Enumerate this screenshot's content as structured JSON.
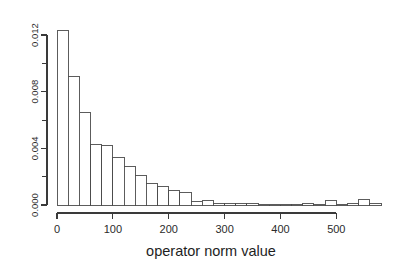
{
  "figure": {
    "background_color": "#ffffff",
    "axis_color": "#3a3a3a",
    "bar_fill_color": "#ffffff",
    "bar_stroke_color": "#4a4a4a"
  },
  "chart_data": {
    "type": "bar",
    "subtype": "histogram",
    "title": "",
    "subtitle": "",
    "xlabel": "operator norm value",
    "ylabel": "",
    "grid": false,
    "legend": false,
    "legend_position": "none",
    "xlim": [
      0,
      580
    ],
    "ylim": [
      0,
      0.0132
    ],
    "bin_width": 20,
    "x_ticks": [
      0,
      100,
      200,
      300,
      400,
      500
    ],
    "x_tick_labels": [
      "0",
      "100",
      "200",
      "300",
      "400",
      "500"
    ],
    "y_ticks": [
      0.0,
      0.004,
      0.008,
      0.012
    ],
    "y_tick_labels": [
      "0.000",
      "0.004",
      "0.008",
      "0.012"
    ],
    "y_minor_ticks": [
      0.002,
      0.006,
      0.01
    ],
    "bins": [
      {
        "x0": 0,
        "x1": 20,
        "density": 0.01235
      },
      {
        "x0": 20,
        "x1": 40,
        "density": 0.00905
      },
      {
        "x0": 40,
        "x1": 60,
        "density": 0.00655
      },
      {
        "x0": 60,
        "x1": 80,
        "density": 0.00425
      },
      {
        "x0": 80,
        "x1": 100,
        "density": 0.0042
      },
      {
        "x0": 100,
        "x1": 120,
        "density": 0.00335
      },
      {
        "x0": 120,
        "x1": 140,
        "density": 0.0027
      },
      {
        "x0": 140,
        "x1": 160,
        "density": 0.00205
      },
      {
        "x0": 160,
        "x1": 180,
        "density": 0.0015
      },
      {
        "x0": 180,
        "x1": 200,
        "density": 0.0013
      },
      {
        "x0": 200,
        "x1": 220,
        "density": 0.00105
      },
      {
        "x0": 220,
        "x1": 240,
        "density": 0.0009
      },
      {
        "x0": 240,
        "x1": 260,
        "density": 0.00022
      },
      {
        "x0": 260,
        "x1": 280,
        "density": 0.0003
      },
      {
        "x0": 280,
        "x1": 300,
        "density": 8e-05
      },
      {
        "x0": 300,
        "x1": 320,
        "density": 0.00014
      },
      {
        "x0": 320,
        "x1": 340,
        "density": 8e-05
      },
      {
        "x0": 340,
        "x1": 360,
        "density": 0.00014
      },
      {
        "x0": 360,
        "x1": 380,
        "density": 6e-05
      },
      {
        "x0": 380,
        "x1": 400,
        "density": 4e-05
      },
      {
        "x0": 400,
        "x1": 420,
        "density": 4e-05
      },
      {
        "x0": 420,
        "x1": 440,
        "density": 4e-05
      },
      {
        "x0": 440,
        "x1": 460,
        "density": 0.0001
      },
      {
        "x0": 460,
        "x1": 480,
        "density": 6e-05
      },
      {
        "x0": 480,
        "x1": 500,
        "density": 0.00032
      },
      {
        "x0": 500,
        "x1": 520,
        "density": 4e-05
      },
      {
        "x0": 520,
        "x1": 540,
        "density": 8e-05
      },
      {
        "x0": 540,
        "x1": 560,
        "density": 0.00036
      },
      {
        "x0": 560,
        "x1": 580,
        "density": 0.0001
      }
    ]
  }
}
